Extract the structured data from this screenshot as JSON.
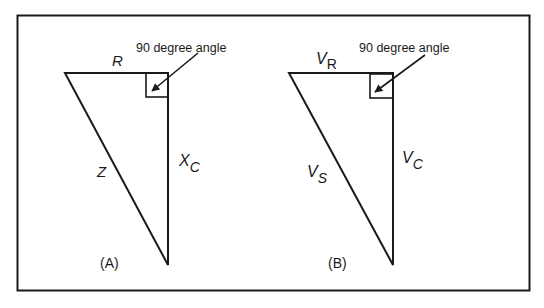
{
  "figure": {
    "panels": [
      {
        "id": "A",
        "caption": "(A)",
        "annotation": "90 degree angle",
        "horizontal_side": {
          "main": "R",
          "sub": ""
        },
        "vertical_side": {
          "main": "X",
          "sub": "C"
        },
        "hypotenuse": {
          "main": "Z",
          "sub": ""
        }
      },
      {
        "id": "B",
        "caption": "(B)",
        "annotation": "90 degree angle",
        "horizontal_side": {
          "main": "V",
          "sub": "R"
        },
        "vertical_side": {
          "main": "V",
          "sub": "C"
        },
        "hypotenuse": {
          "main": "V",
          "sub": "S"
        }
      }
    ],
    "colors": {
      "line": "#1a1a1a",
      "background": "#ffffff"
    }
  }
}
